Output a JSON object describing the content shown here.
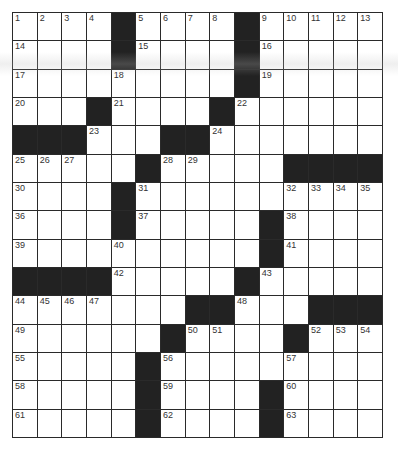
{
  "puzzle": {
    "rows": 15,
    "cols": 15,
    "colors": {
      "block": "#222222",
      "cell": "#ffffff",
      "line": "#2a2a2a"
    },
    "grid": [
      "1,2,3,4,#,5,6,7,8,#,9,10,11,12,13",
      "14,.,.,.,#,15,.,.,.,#,16,.,.,.,.",
      "17,.,.,.,18,.,.,.,.,#,19,.,.,.,.",
      "20,.,.,#,21,.,.,.,#,22,.,.,.,.,.",
      "#,#,#,23,.,.,#,#,24,.,.,.,.,.,.",
      "25,26,27,.,.,#,28,29,.,.,.,#,#,#,#",
      "30,.,.,.,#,31,.,.,.,.,.,32,33,34,35",
      "36,.,.,.,#,37,.,.,.,.,#,38,.,.,.",
      "39,.,.,.,40,.,.,.,.,.,#,41,.,.,.",
      "#,#,#,#,42,.,.,.,.,#,43,.,.,.,.",
      "44,45,46,47,.,.,.,#,#,48,.,.,#,#,#",
      "49,.,.,.,.,.,#,50,51,.,.,#,52,53,54",
      "55,.,.,.,.,#,56,.,.,.,.,57,.,.,.",
      "58,.,.,.,.,#,59,.,.,.,#,60,.,.,.",
      "61,.,.,.,.,#,62,.,.,.,#,63,.,.,."
    ]
  }
}
